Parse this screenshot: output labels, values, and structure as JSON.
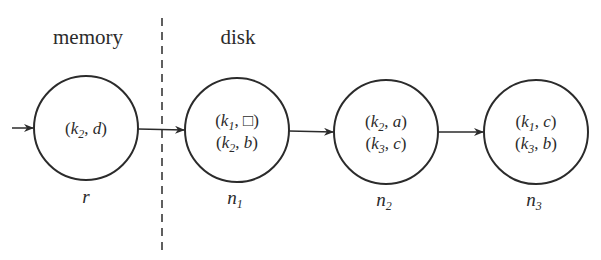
{
  "regions": {
    "memory": {
      "label": "memory"
    },
    "disk": {
      "label": "disk"
    }
  },
  "nodes": [
    {
      "id": "r",
      "label": "r",
      "label_sub": "",
      "entries": [
        {
          "key": "k",
          "key_sub": "2",
          "value": "d"
        }
      ]
    },
    {
      "id": "n1",
      "label": "n",
      "label_sub": "1",
      "entries": [
        {
          "key": "k",
          "key_sub": "1",
          "value": "□"
        },
        {
          "key": "k",
          "key_sub": "2",
          "value": "b"
        }
      ]
    },
    {
      "id": "n2",
      "label": "n",
      "label_sub": "2",
      "entries": [
        {
          "key": "k",
          "key_sub": "2",
          "value": "a"
        },
        {
          "key": "k",
          "key_sub": "3",
          "value": "c"
        }
      ]
    },
    {
      "id": "n3",
      "label": "n",
      "label_sub": "3",
      "entries": [
        {
          "key": "k",
          "key_sub": "1",
          "value": "c"
        },
        {
          "key": "k",
          "key_sub": "3",
          "value": "b"
        }
      ]
    }
  ],
  "edges": [
    {
      "from": "entry",
      "to": "r"
    },
    {
      "from": "r",
      "to": "n1"
    },
    {
      "from": "n1",
      "to": "n2"
    },
    {
      "from": "n2",
      "to": "n3"
    }
  ],
  "colors": {
    "stroke": "#2b2b2b",
    "background": "#ffffff"
  }
}
